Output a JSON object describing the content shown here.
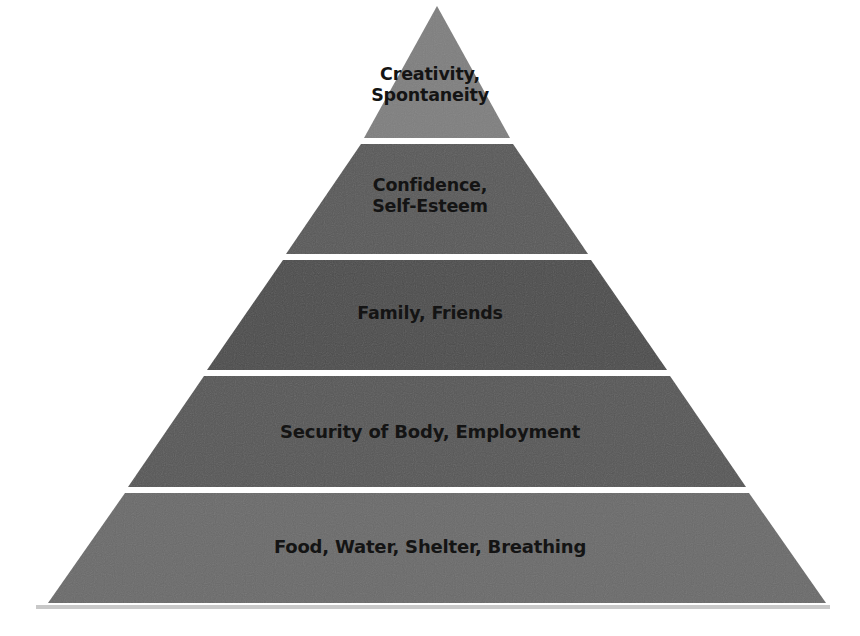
{
  "diagram": {
    "type": "pyramid",
    "layer_count": 5,
    "layers": [
      {
        "level": 1,
        "lines": [
          "Creativity,",
          "Spontaneity"
        ],
        "color": "#7f7f7f"
      },
      {
        "level": 2,
        "lines": [
          "Confidence,",
          "Self-Esteem"
        ],
        "color": "#585858"
      },
      {
        "level": 3,
        "lines": [
          "Family, Friends"
        ],
        "color": "#4b4b4b"
      },
      {
        "level": 4,
        "lines": [
          "Security of Body, Employment"
        ],
        "color": "#575757"
      },
      {
        "level": 5,
        "lines": [
          "Food, Water, Shelter, Breathing"
        ],
        "color": "#6b6b6b"
      }
    ],
    "separator_color": "#ffffff",
    "shadow_color": "#c8c8c8"
  }
}
